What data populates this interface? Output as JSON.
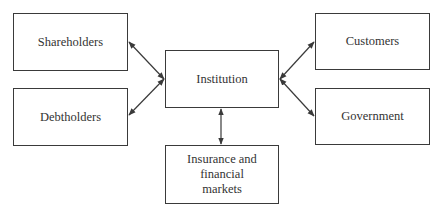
{
  "diagram": {
    "nodes": [
      {
        "id": "shareholders",
        "label": "Shareholders",
        "x": 13,
        "y": 13,
        "w": 115,
        "h": 58
      },
      {
        "id": "debtholders",
        "label": "Debtholders",
        "x": 13,
        "y": 88,
        "w": 115,
        "h": 58
      },
      {
        "id": "institution",
        "label": "Institution",
        "x": 165,
        "y": 50,
        "w": 114,
        "h": 58
      },
      {
        "id": "customers",
        "label": "Customers",
        "x": 315,
        "y": 13,
        "w": 115,
        "h": 57
      },
      {
        "id": "government",
        "label": "Government",
        "x": 315,
        "y": 88,
        "w": 115,
        "h": 57
      },
      {
        "id": "insurance",
        "label": "Insurance and financial markets",
        "x": 165,
        "y": 145,
        "w": 114,
        "h": 59
      }
    ],
    "edges": [
      {
        "from": "shareholders",
        "to": "institution",
        "bidirectional": true
      },
      {
        "from": "debtholders",
        "to": "institution",
        "bidirectional": true
      },
      {
        "from": "customers",
        "to": "institution",
        "bidirectional": true
      },
      {
        "from": "government",
        "to": "institution",
        "bidirectional": true
      },
      {
        "from": "insurance",
        "to": "institution",
        "bidirectional": true
      }
    ]
  },
  "labels": {
    "shareholders": "Shareholders",
    "debtholders": "Debtholders",
    "institution": "Institution",
    "customers": "Customers",
    "government": "Government",
    "insurance_line1": "Insurance and",
    "insurance_line2": "financial",
    "insurance_line3": "markets"
  }
}
